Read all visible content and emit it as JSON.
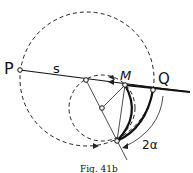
{
  "figure": {
    "caption": "Fig. 41b",
    "labels": {
      "P": "P",
      "s": "s",
      "M": "M",
      "Q": "Q",
      "angle": "2α"
    }
  }
}
